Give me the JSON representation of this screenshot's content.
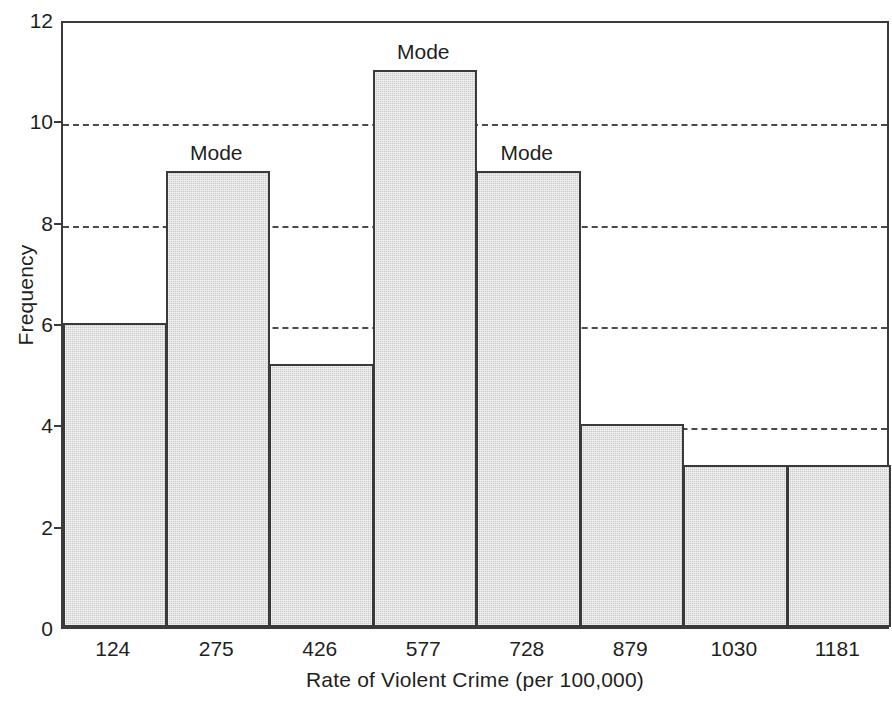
{
  "chart_data": {
    "type": "bar",
    "title": "",
    "subtitle": "",
    "xlabel": "Rate of Violent Crime (per 100,000)",
    "ylabel": "Frequency",
    "categories": [
      "124",
      "275",
      "426",
      "577",
      "728",
      "879",
      "1030",
      "1181"
    ],
    "values": [
      6,
      9,
      5.2,
      11,
      9,
      4,
      3.2,
      3.2
    ],
    "ylim": [
      0,
      12
    ],
    "yticks": [
      0,
      2,
      4,
      6,
      8,
      10,
      12
    ],
    "ytick_labels": [
      "0",
      "2",
      "4",
      "6",
      "8",
      "10",
      "12"
    ],
    "gridlines": [
      2,
      4,
      6,
      8,
      10
    ],
    "grid": "horizontal-dashed",
    "legend": "none",
    "bar_fill_color": "#c9c9c9",
    "bar_edge_color": "#3a3a3a",
    "axis_color": "#3a3a3a",
    "annotations": [
      {
        "text": "Mode",
        "category": "275",
        "value": 9
      },
      {
        "text": "Mode",
        "category": "577",
        "value": 11
      },
      {
        "text": "Mode",
        "category": "728",
        "value": 9
      }
    ]
  }
}
